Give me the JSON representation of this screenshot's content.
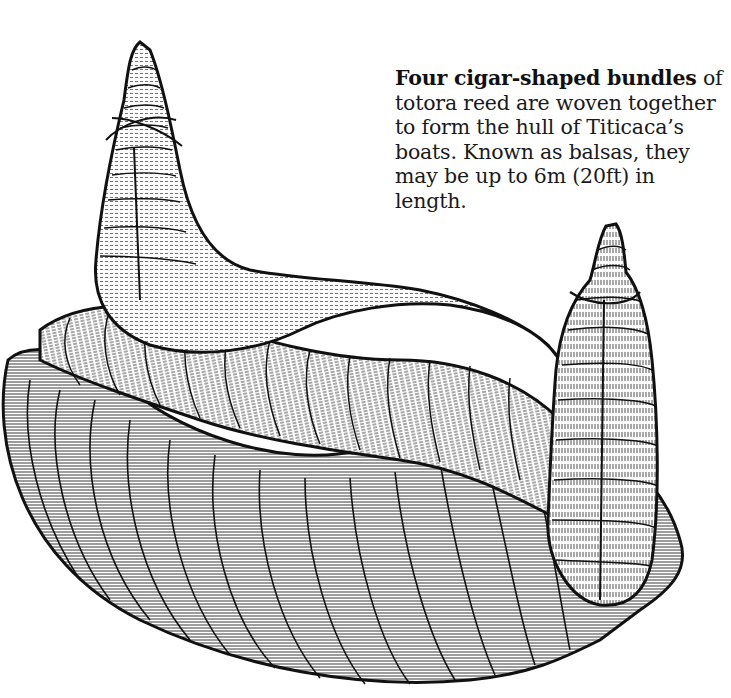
{
  "caption": {
    "lead": "Four cigar-shaped bundles",
    "body": " of totora reed are woven together to form the hull of Titicaca’s boats. Known as balsas, they may be up to 6m (20ft) in length."
  },
  "illustration": {
    "subject": "totora reed boat hull (balsa)",
    "style": "pen-and-ink hatching",
    "ink_color": "#111111",
    "paper_color": "#ffffff"
  }
}
